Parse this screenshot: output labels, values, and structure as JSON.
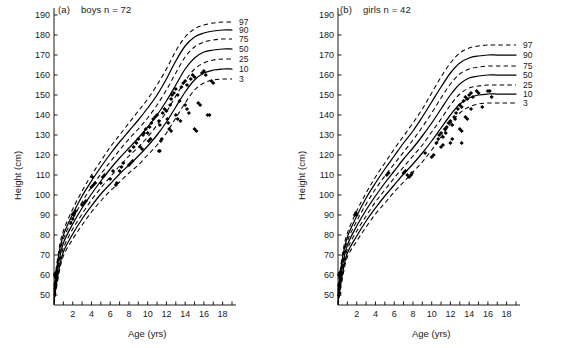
{
  "figure": {
    "panels": [
      {
        "id": "a",
        "tag": "(a)",
        "title": "boys n = 72",
        "n": 72
      },
      {
        "id": "b",
        "tag": "(b)",
        "title": "girls n = 42",
        "n": 42
      }
    ],
    "axis_labels": {
      "x": "Age (yrs)",
      "y": "Height (cm)"
    }
  },
  "chart_data": [
    {
      "type": "line",
      "title": "(a)  boys n = 72",
      "xlabel": "Age (yrs)",
      "ylabel": "Height (cm)",
      "xlim": [
        0,
        19
      ],
      "ylim": [
        45,
        192
      ],
      "grid": false,
      "legend_position": "right-inline-labels",
      "xticks": [
        0,
        1,
        2,
        3,
        4,
        5,
        6,
        7,
        8,
        9,
        10,
        11,
        12,
        13,
        14,
        15,
        16,
        17,
        18,
        19
      ],
      "xticklabels": [
        "",
        "",
        "2",
        "",
        "4",
        "",
        "6",
        "",
        "8",
        "",
        "10",
        "",
        "12",
        "",
        "14",
        "",
        "16",
        "",
        "18",
        ""
      ],
      "yticks": [
        50,
        60,
        70,
        80,
        90,
        100,
        110,
        120,
        130,
        140,
        150,
        160,
        170,
        180,
        190
      ],
      "yticklabels": [
        "50",
        "60",
        "70",
        "80",
        "90",
        "100",
        "110",
        "120",
        "130",
        "140",
        "150",
        "160",
        "170",
        "180",
        "190"
      ],
      "x": [
        0,
        0.5,
        1,
        2,
        3,
        4,
        5,
        6,
        7,
        8,
        9,
        10,
        11,
        12,
        13,
        14,
        15,
        16,
        17,
        18,
        19
      ],
      "series": [
        {
          "name": "97",
          "style": "dashed",
          "values": [
            54.5,
            72,
            82,
            93,
            102,
            110,
            117,
            124,
            130,
            136,
            142,
            148,
            155,
            163,
            172,
            179,
            183,
            185,
            186,
            186.5,
            186.5
          ]
        },
        {
          "name": "90",
          "style": "solid",
          "values": [
            53,
            70,
            80,
            90.5,
            99.5,
            107,
            114,
            120.5,
            126.5,
            132,
            137.5,
            143.5,
            150,
            158,
            167,
            174.5,
            179,
            181,
            182,
            182.5,
            182.5
          ]
        },
        {
          "name": "75",
          "style": "dashed",
          "values": [
            51.5,
            68,
            78,
            88,
            96.5,
            104,
            110.5,
            116.5,
            122.5,
            128,
            133,
            138.5,
            145,
            152.5,
            161,
            169,
            174,
            176.5,
            177.5,
            178,
            178
          ]
        },
        {
          "name": "50",
          "style": "solid",
          "values": [
            50,
            66,
            76,
            85.5,
            93.5,
            100.5,
            107,
            113,
            118.5,
            123.5,
            128.5,
            134,
            140,
            147,
            155,
            163,
            168.5,
            171.5,
            172.5,
            173,
            173
          ]
        },
        {
          "name": "25",
          "style": "dashed",
          "values": [
            48.5,
            64,
            73.5,
            83,
            90.5,
            97.5,
            103.5,
            109,
            114.5,
            119.5,
            124,
            129,
            135,
            141.5,
            149.5,
            157,
            163,
            166,
            167.5,
            168,
            168
          ]
        },
        {
          "name": "10",
          "style": "solid",
          "values": [
            47,
            62,
            71.5,
            80.5,
            88,
            94.5,
            100.5,
            105.5,
            110.5,
            115,
            119.5,
            124.5,
            130,
            136.5,
            144,
            151.5,
            157.5,
            161,
            162.5,
            163,
            163
          ]
        },
        {
          "name": "3",
          "style": "dashed",
          "values": [
            45.5,
            60,
            69.5,
            78,
            85,
            91.5,
            97,
            102,
            106.5,
            111,
            115,
            120,
            125,
            131,
            138.5,
            146,
            152.5,
            156,
            157.5,
            158,
            158
          ]
        }
      ],
      "scatter": {
        "marker": "diamond",
        "points": [
          [
            0.1,
            60
          ],
          [
            0.12,
            60.5
          ],
          [
            0.15,
            59
          ],
          [
            0.2,
            61
          ],
          [
            0.25,
            60
          ],
          [
            0.3,
            61.5
          ],
          [
            0.18,
            60.2
          ],
          [
            1.8,
            86
          ],
          [
            2.0,
            88
          ],
          [
            2.1,
            90
          ],
          [
            2.2,
            91
          ],
          [
            2.0,
            90.5
          ],
          [
            2.3,
            92
          ],
          [
            3.0,
            95
          ],
          [
            3.2,
            96
          ],
          [
            3.4,
            97
          ],
          [
            4.0,
            104
          ],
          [
            4.1,
            109
          ],
          [
            4.2,
            105
          ],
          [
            4.4,
            106
          ],
          [
            5.0,
            106
          ],
          [
            5.2,
            109
          ],
          [
            5.4,
            110
          ],
          [
            6.0,
            108
          ],
          [
            6.3,
            112
          ],
          [
            6.6,
            105
          ],
          [
            6.7,
            106
          ],
          [
            7.0,
            112
          ],
          [
            7.2,
            114
          ],
          [
            7.4,
            116
          ],
          [
            8.0,
            115
          ],
          [
            8.2,
            116
          ],
          [
            8.4,
            117
          ],
          [
            8.1,
            122
          ],
          [
            8.5,
            124
          ],
          [
            8.8,
            126
          ],
          [
            9.0,
            128
          ],
          [
            9.2,
            124
          ],
          [
            9.4,
            123
          ],
          [
            9.5,
            130
          ],
          [
            9.6,
            131
          ],
          [
            9.8,
            133
          ],
          [
            10.0,
            131
          ],
          [
            10.2,
            134
          ],
          [
            10.4,
            136
          ],
          [
            10.1,
            127
          ],
          [
            10.3,
            128
          ],
          [
            10.6,
            138
          ],
          [
            10.8,
            139
          ],
          [
            11.0,
            140
          ],
          [
            11.2,
            137
          ],
          [
            11.3,
            135
          ],
          [
            11.2,
            122
          ],
          [
            11.4,
            127
          ],
          [
            11.5,
            128
          ],
          [
            11.6,
            141
          ],
          [
            11.8,
            143
          ],
          [
            12.0,
            142
          ],
          [
            12.1,
            138
          ],
          [
            12.2,
            136
          ],
          [
            12.4,
            145
          ],
          [
            12.5,
            148
          ],
          [
            12.6,
            150
          ],
          [
            12.3,
            133
          ],
          [
            12.5,
            132
          ],
          [
            12.8,
            151
          ],
          [
            13.0,
            153
          ],
          [
            13.2,
            150
          ],
          [
            13.4,
            147
          ],
          [
            13.0,
            140
          ],
          [
            13.2,
            138
          ],
          [
            13.5,
            137
          ],
          [
            13.6,
            154
          ],
          [
            13.8,
            156
          ],
          [
            14.0,
            157
          ],
          [
            14.2,
            155
          ],
          [
            14.0,
            145
          ],
          [
            14.2,
            143
          ],
          [
            14.4,
            141
          ],
          [
            14.6,
            158
          ],
          [
            14.8,
            160
          ],
          [
            15.0,
            159
          ],
          [
            15.0,
            133
          ],
          [
            15.2,
            132
          ],
          [
            15.4,
            146
          ],
          [
            15.6,
            145
          ],
          [
            15.8,
            161
          ],
          [
            16.0,
            162
          ],
          [
            16.2,
            160
          ],
          [
            16.4,
            140
          ],
          [
            16.6,
            140
          ],
          [
            16.8,
            157
          ],
          [
            17.0,
            156
          ],
          [
            11.3,
            122
          ]
        ]
      },
      "percentile_labels": [
        "97",
        "90",
        "75",
        "50",
        "25",
        "10",
        "3"
      ]
    },
    {
      "type": "line",
      "title": "(b)  girls n = 42",
      "xlabel": "Age (yrs)",
      "ylabel": "Height (cm)",
      "xlim": [
        0,
        19
      ],
      "ylim": [
        45,
        192
      ],
      "grid": false,
      "legend_position": "right-inline-labels",
      "xticks": [
        0,
        1,
        2,
        3,
        4,
        5,
        6,
        7,
        8,
        9,
        10,
        11,
        12,
        13,
        14,
        15,
        16,
        17,
        18,
        19
      ],
      "xticklabels": [
        "",
        "",
        "2",
        "",
        "4",
        "",
        "6",
        "",
        "8",
        "",
        "10",
        "",
        "12",
        "",
        "14",
        "",
        "16",
        "",
        "18",
        ""
      ],
      "yticks": [
        50,
        60,
        70,
        80,
        90,
        100,
        110,
        120,
        130,
        140,
        150,
        160,
        170,
        180,
        190
      ],
      "yticklabels": [
        "50",
        "60",
        "70",
        "80",
        "90",
        "100",
        "110",
        "120",
        "130",
        "140",
        "150",
        "160",
        "170",
        "180",
        "190"
      ],
      "x": [
        0,
        0.5,
        1,
        2,
        3,
        4,
        5,
        6,
        7,
        8,
        9,
        10,
        11,
        12,
        13,
        14,
        15,
        16,
        17,
        18,
        19
      ],
      "series": [
        {
          "name": "97",
          "style": "dashed",
          "values": [
            54,
            71,
            81,
            92,
            101,
            109,
            116,
            123,
            129.5,
            136,
            143,
            151,
            159,
            166,
            171,
            173.5,
            174.5,
            175,
            175,
            175,
            175
          ]
        },
        {
          "name": "90",
          "style": "solid",
          "values": [
            52.5,
            69,
            79,
            89.5,
            98.5,
            106,
            113,
            119.5,
            126,
            132,
            139,
            146.5,
            154,
            161,
            166,
            168.5,
            169.5,
            170,
            170,
            170,
            170
          ]
        },
        {
          "name": "75",
          "style": "dashed",
          "values": [
            51,
            67,
            77,
            87,
            95.5,
            103,
            109.5,
            115.5,
            121.5,
            127.5,
            134,
            141,
            148.5,
            155.5,
            160.5,
            163,
            164,
            164.5,
            164.5,
            164.5,
            164.5
          ]
        },
        {
          "name": "50",
          "style": "solid",
          "values": [
            49.5,
            65,
            75,
            84.5,
            92.5,
            99.5,
            106,
            112,
            118,
            123.5,
            129.5,
            136,
            143,
            150,
            155.5,
            158.5,
            159.5,
            160,
            160,
            160,
            160
          ]
        },
        {
          "name": "25",
          "style": "dashed",
          "values": [
            48,
            63,
            73,
            82,
            89.5,
            96.5,
            102.5,
            108.5,
            114,
            119.5,
            125,
            131.5,
            138,
            145,
            150.5,
            153.5,
            154.5,
            155,
            155,
            155,
            155
          ]
        },
        {
          "name": "10",
          "style": "solid",
          "values": [
            46.5,
            61,
            71,
            79.5,
            87,
            93.5,
            99.5,
            105,
            110.5,
            115.5,
            121,
            127,
            133.5,
            140,
            145.5,
            148.5,
            150,
            150.5,
            150.5,
            150.5,
            150.5
          ]
        },
        {
          "name": "3",
          "style": "dashed",
          "values": [
            45,
            59,
            69,
            77,
            84,
            90.5,
            96,
            101.5,
            106.5,
            111.5,
            116.5,
            122.5,
            129,
            135.5,
            141,
            144,
            145.5,
            146,
            146,
            146,
            146
          ]
        }
      ],
      "scatter": {
        "marker": "diamond",
        "points": [
          [
            0.1,
            60
          ],
          [
            0.15,
            61
          ],
          [
            0.2,
            59
          ],
          [
            0.12,
            55
          ],
          [
            0.1,
            50
          ],
          [
            0.18,
            51
          ],
          [
            1.8,
            90
          ],
          [
            1.9,
            91
          ],
          [
            2.0,
            90
          ],
          [
            5.2,
            110
          ],
          [
            5.4,
            111
          ],
          [
            7.0,
            111
          ],
          [
            7.2,
            112
          ],
          [
            7.4,
            110
          ],
          [
            7.6,
            109
          ],
          [
            7.8,
            110
          ],
          [
            7.9,
            111
          ],
          [
            9.3,
            121
          ],
          [
            10.0,
            119
          ],
          [
            10.2,
            120
          ],
          [
            10.5,
            126
          ],
          [
            10.7,
            128
          ],
          [
            10.8,
            130
          ],
          [
            11.0,
            131
          ],
          [
            11.2,
            129
          ],
          [
            11.0,
            124
          ],
          [
            11.2,
            125
          ],
          [
            11.4,
            133
          ],
          [
            11.6,
            134
          ],
          [
            11.5,
            131
          ],
          [
            11.8,
            136
          ],
          [
            12.0,
            137
          ],
          [
            12.2,
            135
          ],
          [
            12.0,
            126
          ],
          [
            12.2,
            128
          ],
          [
            12.4,
            139
          ],
          [
            12.6,
            141
          ],
          [
            12.5,
            138
          ],
          [
            12.8,
            143
          ],
          [
            13.0,
            145
          ],
          [
            13.2,
            144
          ],
          [
            13.0,
            133
          ],
          [
            13.2,
            132
          ],
          [
            13.4,
            147
          ],
          [
            13.6,
            149
          ],
          [
            13.8,
            148
          ],
          [
            13.6,
            139
          ],
          [
            13.8,
            138
          ],
          [
            14.0,
            150
          ],
          [
            14.2,
            151
          ],
          [
            14.4,
            149
          ],
          [
            14.2,
            143
          ],
          [
            14.8,
            152
          ],
          [
            15.0,
            151
          ],
          [
            15.4,
            144
          ],
          [
            16.0,
            152
          ],
          [
            16.2,
            152
          ],
          [
            16.4,
            149
          ],
          [
            13.2,
            126
          ]
        ]
      },
      "percentile_labels": [
        "97",
        "90",
        "75",
        "50",
        "25",
        "10",
        "3"
      ]
    }
  ]
}
